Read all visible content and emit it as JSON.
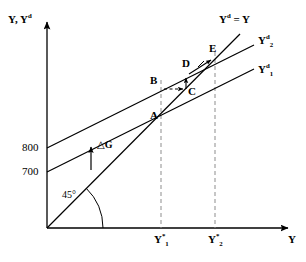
{
  "figure": {
    "kind": "keynesian-cross-diagram",
    "background_color": "#ffffff",
    "ink_color": "#000000",
    "dashed_color": "#888888",
    "width": 306,
    "height": 262
  },
  "axes": {
    "y_axis_title": "Y, Y",
    "y_axis_title_sup": "d",
    "x_axis_title": "Y",
    "origin_px": [
      47,
      228
    ],
    "y_axis_top_px": 20,
    "x_axis_right_px": 290
  },
  "y_ticks": [
    {
      "label": "800",
      "value": 800,
      "y_px": 148
    },
    {
      "label": "700",
      "value": 700,
      "y_px": 172
    }
  ],
  "x_ticks": [
    {
      "label": "Y",
      "sup": "*",
      "sub": "1",
      "x_px": 161
    },
    {
      "label": "Y",
      "sup": "*",
      "sub": "2",
      "x_px": 215
    }
  ],
  "lines": [
    {
      "name": "forty-five-degree-line",
      "label": "Y",
      "label_sup": "d",
      "label_rest": " = Y",
      "label_pos_px": [
        219,
        14
      ],
      "from_px": [
        47,
        228
      ],
      "to_px": [
        240,
        34
      ]
    },
    {
      "name": "aggregate-demand-line-2",
      "label": "Y",
      "label_sup": "d",
      "label_sub": "2",
      "label_pos_px": [
        258,
        35
      ],
      "from_px": [
        47,
        148
      ],
      "to_px": [
        254,
        45
      ]
    },
    {
      "name": "aggregate-demand-line-1",
      "label": "Y",
      "label_sup": "d",
      "label_sub": "1",
      "label_pos_px": [
        258,
        64
      ],
      "from_px": [
        47,
        172
      ],
      "to_px": [
        254,
        69
      ]
    }
  ],
  "points": [
    {
      "name": "point-a",
      "label": "A",
      "x_px": 161,
      "y_px": 117,
      "label_pos_px": [
        150,
        108
      ]
    },
    {
      "name": "point-b",
      "label": "B",
      "x_px": 161,
      "y_px": 89,
      "label_pos_px": [
        150,
        77
      ]
    },
    {
      "name": "point-c",
      "label": "C",
      "x_px": 186,
      "y_px": 89,
      "label_pos_px": [
        188,
        88
      ]
    },
    {
      "name": "point-d",
      "label": "D",
      "x_px": 186,
      "y_px": 76,
      "label_pos_px": [
        182,
        60
      ]
    },
    {
      "name": "point-e",
      "label": "E",
      "x_px": 215,
      "y_px": 57,
      "label_pos_px": [
        209,
        45
      ]
    }
  ],
  "annotations": {
    "delta_g_label": "△G",
    "delta_g_label_pos_px": [
      98,
      140
    ],
    "delta_g_arrow_from_px": [
      91,
      170
    ],
    "delta_g_arrow_to_px": [
      91,
      146
    ],
    "angle_label": "45°",
    "angle_label_pos_px": [
      64,
      190
    ]
  },
  "adjustment_arrows": [
    {
      "name": "arrow-b-to-c",
      "style": "dashed-horizontal",
      "from_px": [
        163,
        89
      ],
      "to_px": [
        184,
        89
      ]
    },
    {
      "name": "arrow-c-to-d",
      "style": "solid-vertical",
      "from_px": [
        186,
        88
      ],
      "to_px": [
        186,
        78
      ]
    },
    {
      "name": "arrow-d-to-e",
      "style": "solid-diagonal",
      "from_px": [
        188,
        74
      ],
      "to_px": [
        212,
        59
      ]
    }
  ],
  "dashed_drop_lines": [
    {
      "name": "drop-line-y1",
      "x_px": 161,
      "from_y_px": 80,
      "to_y_px": 228
    },
    {
      "name": "drop-line-y2",
      "x_px": 215,
      "from_y_px": 52,
      "to_y_px": 228
    }
  ]
}
